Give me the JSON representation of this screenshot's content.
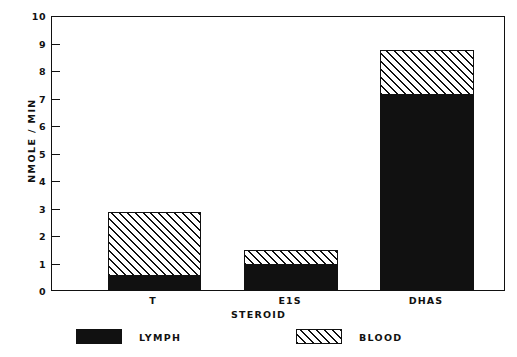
{
  "chart_data": {
    "type": "bar",
    "stacked": true,
    "title": "",
    "xlabel": "STEROID",
    "ylabel": "NMOLE / MIN",
    "categories": [
      "T",
      "E1S",
      "DHAS"
    ],
    "series": [
      {
        "name": "LYMPH",
        "values": [
          0.5,
          0.9,
          7.15
        ]
      },
      {
        "name": "BLOOD",
        "values": [
          2.35,
          0.55,
          1.65
        ]
      }
    ],
    "totals": [
      2.85,
      1.45,
      8.8
    ],
    "ylim": [
      0,
      10
    ],
    "yticks": [
      "0",
      "1",
      "2",
      "3",
      "4",
      "5",
      "6",
      "7",
      "8",
      "9",
      "10"
    ],
    "grid": false,
    "legend_position": "bottom"
  },
  "axes": {
    "y_title": "NMOLE / MIN",
    "x_title": "STEROID",
    "y_tick_labels": [
      "10",
      "9",
      "8",
      "7",
      "6",
      "5",
      "4",
      "3",
      "2",
      "1",
      "0"
    ],
    "x_tick_labels": [
      "T",
      "E1S",
      "DHAS"
    ]
  },
  "legend": {
    "items": [
      {
        "label": "LYMPH",
        "fill": "solid-black",
        "color": "#111111"
      },
      {
        "label": "BLOOD",
        "fill": "diagonal-hatch",
        "color": "#111111"
      }
    ]
  },
  "colors": {
    "ink": "#111111",
    "paper": "#ffffff"
  }
}
